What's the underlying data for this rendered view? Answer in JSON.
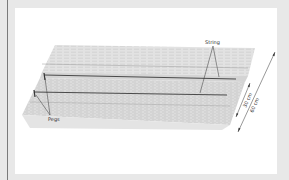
{
  "figure": {
    "labels": {
      "string": "String",
      "pegs": "Pegs",
      "inner_width": "30 cm",
      "outer_width": "60 cm"
    },
    "colors": {
      "frame": "#e8e8e8",
      "panel": "#ffffff",
      "soil": "#cfcfcf",
      "string": "#555555",
      "text": "#333333"
    }
  }
}
